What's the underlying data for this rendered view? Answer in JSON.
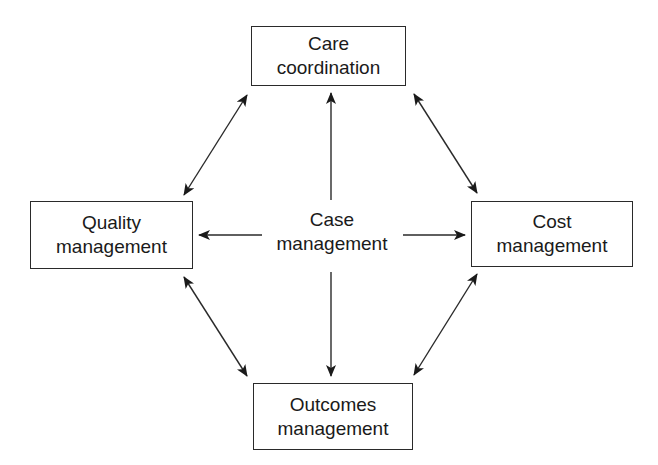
{
  "diagram": {
    "center": {
      "line1": "Case",
      "line2": "management"
    },
    "nodes": {
      "top": {
        "line1": "Care",
        "line2": "coordination"
      },
      "left": {
        "line1": "Quality",
        "line2": "management"
      },
      "right": {
        "line1": "Cost",
        "line2": "management"
      },
      "bottom": {
        "line1": "Outcomes",
        "line2": "management"
      }
    },
    "edges": [
      {
        "from": "Case management",
        "to": "Care coordination",
        "type": "one-way"
      },
      {
        "from": "Case management",
        "to": "Quality management",
        "type": "one-way"
      },
      {
        "from": "Case management",
        "to": "Cost management",
        "type": "one-way"
      },
      {
        "from": "Case management",
        "to": "Outcomes management",
        "type": "one-way"
      },
      {
        "from": "Care coordination",
        "to": "Quality management",
        "type": "bidirectional"
      },
      {
        "from": "Care coordination",
        "to": "Cost management",
        "type": "bidirectional"
      },
      {
        "from": "Quality management",
        "to": "Outcomes management",
        "type": "bidirectional"
      },
      {
        "from": "Cost management",
        "to": "Outcomes management",
        "type": "bidirectional"
      }
    ],
    "colors": {
      "stroke": "#2a2a2a",
      "background": "#ffffff"
    }
  }
}
